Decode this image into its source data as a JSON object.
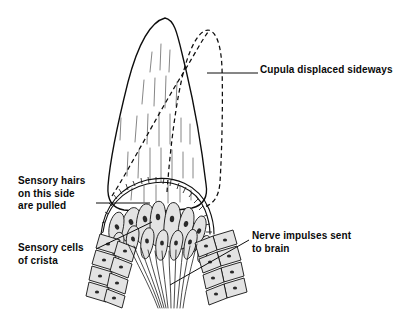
{
  "figure": {
    "background_color": "#ffffff",
    "ink_color": "#0d0d0d",
    "cell_fill_color": "#e3e3e3",
    "nucleus_color": "#2a2a2a"
  },
  "labels": {
    "cupula": {
      "name": "Cupula displaced sideways",
      "line1": "Cupula displaced sideways",
      "x": 260,
      "y": 73
    },
    "hairs": {
      "name": "Sensory hairs on this side are pulled",
      "line1": "Sensory hairs",
      "line2": "on this side",
      "line3": "are pulled",
      "x": 18,
      "y": 184
    },
    "crista": {
      "name": "Sensory cells of crista",
      "line1": "Sensory cells",
      "line2": "of crista",
      "x": 18,
      "y": 251
    },
    "nerve": {
      "name": "Nerve impulses sent to brain",
      "line1": "Nerve impulses sent",
      "line2": "to brain",
      "x": 252,
      "y": 239
    }
  },
  "leaders": {
    "cupula": "M207,73 L258,73",
    "hairs": "M96,203 L150,203",
    "crista": "M96,249 L152,222",
    "nerve": "M249,240 L170,285"
  },
  "geometry": {
    "cupula_solid": "M165,18 C150,22 138,44 128,82 C118,122 110,160 108,186 C107,200 112,208 124,210 C140,212 168,212 192,208 C204,205 208,196 206,184 C202,150 194,104 186,70 C178,38 176,20 165,18 Z",
    "cupula_dashed": "M167,192 C170,150 176,100 184,70 C191,44 200,30 208,30 C216,31 221,44 222,68 C223,100 222,150 220,182 C219,196 214,204 204,207",
    "cupula_dashed_diagonal": "M112,196 C130,168 160,110 185,70 C194,55 201,42 208,32",
    "striations": [
      "M152,52 L150,72",
      "M161,44 L160,70",
      "M170,50 L169,72",
      "M144,80 L142,104",
      "M155,78 L154,106",
      "M166,76 L165,108",
      "M177,82 L176,106",
      "M137,116 L135,142",
      "M148,114 L147,144",
      "M159,112 L159,146",
      "M170,114 L170,144",
      "M181,118 L181,142",
      "M128,152 L127,176",
      "M139,150 L138,178",
      "M150,148 L150,180",
      "M161,148 L161,182",
      "M172,150 L172,180",
      "M183,152 L183,178",
      "M193,158 L193,178",
      "M121,118 L120,140",
      "M190,124 L190,144",
      "M132,188 L131,200",
      "M144,186 L144,202",
      "M156,185 L156,203",
      "M168,185 L168,203",
      "M180,186 L180,202",
      "M191,190 L191,200"
    ],
    "crista_arc": "M103,232 C106,208 122,190 147,184 C172,178 196,188 205,210 C209,220 210,228 210,234",
    "hair_band_outer": "M101,234 C104,206 121,186 147,180 C174,174 199,185 209,209 C213,219 214,227 214,234",
    "hair_segments": [
      "M103,232 L101,234",
      "M105,222 L102,223",
      "M108,214 L105,212",
      "M112,206 L109,203",
      "M117,199 L114,195",
      "M122,194 L119,189",
      "M128,190 L126,184",
      "M135,186 L133,181",
      "M142,184 L141,178",
      "M149,183 L148,177",
      "M156,183 L156,177",
      "M163,184 L164,178",
      "M170,186 L171,180",
      "M177,189 L179,183",
      "M183,193 L186,187",
      "M189,197 L192,193",
      "M194,203 L198,199",
      "M199,210 L203,206",
      "M202,217 L207,215",
      "M205,225 L210,224",
      "M206,232 L212,232"
    ],
    "crista_cells": [
      {
        "d": "M122,236 C120,224 124,214 130,209 C134,206 139,208 140,214 C142,222 140,232 137,238 C134,243 124,244 122,236 Z",
        "nx": 131,
        "ny": 222,
        "rx": 2.2,
        "ry": 3.0,
        "rot": -20
      },
      {
        "d": "M137,238 C135,225 137,212 142,206 C146,202 152,204 153,211 C155,221 153,233 150,240 C147,246 139,246 137,238 Z",
        "nx": 145,
        "ny": 219,
        "rx": 2.2,
        "ry": 3.2,
        "rot": -12
      },
      {
        "d": "M151,240 C149,226 150,211 154,204 C158,199 164,201 165,209 C167,220 166,233 163,241 C160,247 153,248 151,240 Z",
        "nx": 158,
        "ny": 217,
        "rx": 2.2,
        "ry": 3.2,
        "rot": -5
      },
      {
        "d": "M164,241 C163,227 165,211 169,205 C173,200 179,203 180,211 C182,222 180,234 177,242 C174,248 166,249 164,241 Z",
        "nx": 172,
        "ny": 219,
        "rx": 2.2,
        "ry": 3.2,
        "rot": 5
      },
      {
        "d": "M178,243 C177,229 180,215 185,209 C189,205 194,209 194,217 C194,227 191,238 187,245 C184,250 178,251 178,243 Z",
        "nx": 186,
        "ny": 224,
        "rx": 2.2,
        "ry": 3.0,
        "rot": 14
      },
      {
        "d": "M110,240 C107,230 110,219 115,214 C119,210 124,213 124,220 C124,229 121,238 117,244 C113,249 111,247 110,240 Z",
        "nx": 117,
        "ny": 227,
        "rx": 2.0,
        "ry": 2.8,
        "rot": -28
      },
      {
        "d": "M191,245 C190,233 194,221 199,217 C203,214 207,218 206,226 C205,235 201,244 197,249 C194,253 191,252 191,245 Z",
        "nx": 199,
        "ny": 231,
        "rx": 2.0,
        "ry": 2.8,
        "rot": 22
      },
      {
        "d": "M127,248 C125,240 127,231 131,227 C135,224 139,227 139,233 C139,241 136,250 133,255 C130,259 127,256 127,248 Z",
        "nx": 133,
        "ny": 239,
        "rx": 1.9,
        "ry": 2.6,
        "rot": -16
      },
      {
        "d": "M141,250 C140,242 142,233 146,229 C150,226 154,229 154,236 C154,244 151,253 148,257 C145,261 141,258 141,250 Z",
        "nx": 147,
        "ny": 241,
        "rx": 1.9,
        "ry": 2.6,
        "rot": -8
      },
      {
        "d": "M156,251 C155,243 157,234 161,231 C165,228 168,232 168,238 C168,246 166,255 163,259 C160,262 156,259 156,251 Z",
        "nx": 162,
        "ny": 243,
        "rx": 1.9,
        "ry": 2.6,
        "rot": 0
      },
      {
        "d": "M170,251 C169,243 172,234 176,231 C180,229 183,233 183,239 C182,247 180,255 176,259 C173,262 170,259 170,251 Z",
        "nx": 176,
        "ny": 243,
        "rx": 1.9,
        "ry": 2.6,
        "rot": 8
      },
      {
        "d": "M184,250 C184,242 187,233 191,230 C195,228 198,232 197,239 C196,247 193,255 189,258 C186,261 183,258 184,250 Z",
        "nx": 190,
        "ny": 242,
        "rx": 1.9,
        "ry": 2.6,
        "rot": 16
      },
      {
        "d": "M113,252 C111,244 113,236 117,233 C121,231 124,234 124,240 C124,247 121,255 118,259 C115,262 113,259 113,252 Z",
        "nx": 119,
        "ny": 244,
        "rx": 1.8,
        "ry": 2.5,
        "rot": -24
      },
      {
        "d": "M198,255 C197,247 201,239 205,236 C209,234 211,238 210,245 C209,252 205,259 202,262 C199,264 197,261 198,255 Z",
        "nx": 204,
        "ny": 247,
        "rx": 1.8,
        "ry": 2.5,
        "rot": 24
      }
    ],
    "left_wall_cells": [
      {
        "d": "M100,234 L120,240 L116,254 L96,248 Z",
        "nx": 108,
        "ny": 244
      },
      {
        "d": "M96,250 L116,256 L112,270 L92,264 Z",
        "nx": 104,
        "ny": 260
      },
      {
        "d": "M92,266 L112,272 L109,286 L89,280 Z",
        "nx": 100,
        "ny": 276
      },
      {
        "d": "M89,282 L109,288 L106,302 L86,296 Z",
        "nx": 97,
        "ny": 292
      },
      {
        "d": "M118,241 L136,248 L132,262 L114,255 Z",
        "nx": 125,
        "ny": 251
      },
      {
        "d": "M114,257 L132,264 L128,278 L110,271 Z",
        "nx": 121,
        "ny": 267
      },
      {
        "d": "M110,273 L128,280 L125,294 L107,287 Z",
        "nx": 117,
        "ny": 283
      },
      {
        "d": "M107,289 L125,296 L122,308 L104,301 Z",
        "nx": 114,
        "ny": 298
      }
    ],
    "right_wall_cells": [
      {
        "d": "M213,236 L233,230 L237,244 L217,250 Z",
        "nx": 225,
        "ny": 240
      },
      {
        "d": "M217,252 L237,246 L241,260 L221,266 Z",
        "nx": 229,
        "ny": 256
      },
      {
        "d": "M221,268 L241,262 L244,276 L224,282 Z",
        "nx": 232,
        "ny": 272
      },
      {
        "d": "M224,284 L244,278 L247,292 L227,298 Z",
        "nx": 235,
        "ny": 288
      },
      {
        "d": "M195,243 L213,236 L217,250 L199,257 Z",
        "nx": 206,
        "ny": 246
      },
      {
        "d": "M199,259 L217,252 L221,266 L203,273 Z",
        "nx": 210,
        "ny": 262
      },
      {
        "d": "M203,275 L221,268 L224,282 L206,289 Z",
        "nx": 213,
        "ny": 278
      },
      {
        "d": "M206,291 L224,284 L227,298 L209,305 Z",
        "nx": 216,
        "ny": 294
      }
    ],
    "nerve_fibres": [
      "M128,244 C136,262 148,282 158,308",
      "M134,246 C141,264 152,284 160,308",
      "M141,248 C147,266 155,286 162,308",
      "M148,250 C152,268 159,288 164,308",
      "M155,251 C157,270 162,289 166,308",
      "M162,251 C163,270 166,289 168,308",
      "M169,251 C169,270 171,289 171,308",
      "M176,250 C175,269 175,289 174,308",
      "M183,248 C181,267 179,288 177,308",
      "M190,246 C186,265 182,287 180,308",
      "M197,244 C192,263 186,286 183,308"
    ]
  }
}
